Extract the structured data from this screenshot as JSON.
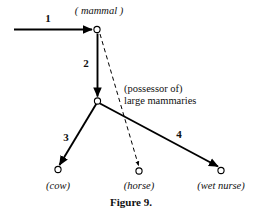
{
  "figure": {
    "caption": "Figure 9.",
    "background_color": "#ffffff",
    "stroke_color": "#000000",
    "width": 262,
    "height": 216
  },
  "nodes": [
    {
      "id": "mammal",
      "label": "( mammal )",
      "style": "italic",
      "x": 97,
      "y": 29,
      "label_x": 99,
      "label_y": 6
    },
    {
      "id": "possessor",
      "label": "(possessor of)\nlarge mammaries",
      "style": "upright",
      "x": 97,
      "y": 101,
      "label_x": 124,
      "label_y": 84
    },
    {
      "id": "cow",
      "label": "(cow)",
      "style": "italic",
      "x": 58,
      "y": 169,
      "label_x": 58,
      "label_y": 179
    },
    {
      "id": "horse",
      "label": "(horse)",
      "style": "italic",
      "x": 139,
      "y": 171,
      "label_x": 139,
      "label_y": 179
    },
    {
      "id": "wet-nurse",
      "label": "(wet nurse)",
      "style": "italic",
      "x": 221,
      "y": 170,
      "label_x": 221,
      "label_y": 179
    }
  ],
  "edges": [
    {
      "id": "edge-1",
      "label": "1",
      "label_x": 48,
      "label_y": 12,
      "dashed": false,
      "from": "start-left",
      "to": "mammal"
    },
    {
      "id": "edge-2",
      "label": "2",
      "label_x": 86,
      "label_y": 57,
      "dashed": false,
      "from": "mammal",
      "to": "possessor"
    },
    {
      "id": "edge-3",
      "label": "3",
      "label_x": 66,
      "label_y": 131,
      "dashed": false,
      "from": "possessor",
      "to": "cow"
    },
    {
      "id": "edge-4",
      "label": "4",
      "label_x": 179,
      "label_y": 128,
      "dashed": false,
      "from": "possessor",
      "to": "wet-nurse"
    },
    {
      "id": "edge-dashed",
      "label": "",
      "label_x": 0,
      "label_y": 0,
      "dashed": true,
      "from": "mammal",
      "to": "horse"
    }
  ],
  "labels": {
    "possessor_line1": "(possessor of)",
    "possessor_line2": "large mammaries"
  }
}
